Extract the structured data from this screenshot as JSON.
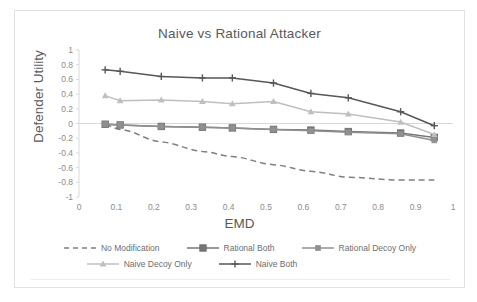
{
  "chart_data": {
    "type": "line",
    "title": "Naive vs Rational Attacker",
    "xlabel": "EMD",
    "ylabel": "Defender Utility",
    "xlim": [
      0,
      1
    ],
    "ylim": [
      -1,
      1
    ],
    "xticks": [
      "0",
      "0.1",
      "0.2",
      "0.3",
      "0.4",
      "0.5",
      "0.6",
      "0.7",
      "0.8",
      "0.9",
      "1"
    ],
    "xtick_values": [
      0,
      0.1,
      0.2,
      0.3,
      0.4,
      0.5,
      0.6,
      0.7,
      0.8,
      0.9,
      1
    ],
    "yticks": [
      "1",
      "0.8",
      "0.6",
      "0.4",
      "0.2",
      "0",
      "-0.2",
      "-0.4",
      "-0.6",
      "-0.8",
      "-1"
    ],
    "ytick_values": [
      1,
      0.8,
      0.6,
      0.4,
      0.2,
      0,
      -0.2,
      -0.4,
      -0.6,
      -0.8,
      -1
    ],
    "grid": false,
    "legend_position": "bottom",
    "x": [
      0.07,
      0.11,
      0.22,
      0.33,
      0.41,
      0.52,
      0.62,
      0.72,
      0.86,
      0.95
    ],
    "series": [
      {
        "name": "No Modification",
        "color": "#808080",
        "style": "dashed",
        "marker": "none",
        "values": [
          -0.02,
          -0.08,
          -0.25,
          -0.38,
          -0.45,
          -0.56,
          -0.65,
          -0.73,
          -0.77,
          -0.77
        ]
      },
      {
        "name": "Rational Both",
        "color": "#767676",
        "style": "solid",
        "marker": "square",
        "values": [
          -0.01,
          -0.02,
          -0.04,
          -0.05,
          -0.06,
          -0.08,
          -0.09,
          -0.11,
          -0.13,
          -0.19
        ]
      },
      {
        "name": "Rational Decoy Only",
        "color": "#909090",
        "style": "solid",
        "marker": "square-small",
        "values": [
          -0.01,
          -0.02,
          -0.04,
          -0.05,
          -0.06,
          -0.08,
          -0.1,
          -0.12,
          -0.14,
          -0.23
        ]
      },
      {
        "name": "Naive Decoy Only",
        "color": "#bfbfbf",
        "style": "solid",
        "marker": "triangle",
        "values": [
          0.38,
          0.31,
          0.32,
          0.3,
          0.27,
          0.3,
          0.16,
          0.13,
          0.02,
          -0.15
        ]
      },
      {
        "name": "Naive Both",
        "color": "#575757",
        "style": "solid",
        "marker": "plus",
        "values": [
          0.73,
          0.71,
          0.64,
          0.62,
          0.62,
          0.55,
          0.41,
          0.35,
          0.16,
          -0.03
        ]
      }
    ]
  },
  "legend": {
    "rows": [
      [
        "No Modification",
        "Rational Both",
        "Rational Decoy Only"
      ],
      [
        "Naive Decoy Only",
        "Naive Both"
      ]
    ]
  },
  "colors": {
    "axis": "#d9d9d9",
    "text": "#595959",
    "tick_text": "#8c8c8c",
    "border": "#e2e2e2"
  }
}
